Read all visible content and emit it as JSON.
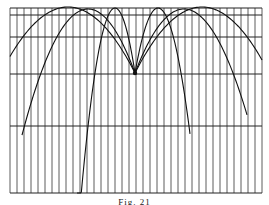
{
  "figure": {
    "caption": "Fig. 21",
    "colors": {
      "ink": "#1a1a1a",
      "paper": "#ffffff",
      "grid": "#333333"
    }
  },
  "diagram_data": {
    "frame": {
      "left": 10,
      "right": 262,
      "top": 8,
      "bottom": 193
    },
    "horizontal_lines_y": [
      8,
      15,
      37,
      74,
      126,
      193
    ],
    "vertical_spacing": 7,
    "launch_point": {
      "x": 135,
      "y": 73
    },
    "trajectories": [
      {
        "name": "outer-left",
        "peak": [
          68,
          7
        ],
        "end": [
          10,
          72
        ]
      },
      {
        "name": "mid-left",
        "peak": [
          88,
          9
        ],
        "end": [
          22,
          193
        ]
      },
      {
        "name": "inner-left",
        "peak": [
          115,
          8
        ],
        "end": [
          77,
          193
        ]
      },
      {
        "name": "inner-right",
        "peak": [
          158,
          8
        ],
        "end": [
          190,
          193
        ]
      },
      {
        "name": "mid-right",
        "peak": [
          184,
          9
        ],
        "end": [
          247,
          193
        ]
      },
      {
        "name": "outer-right",
        "peak": [
          202,
          7
        ],
        "end": [
          262,
          72
        ]
      }
    ]
  }
}
